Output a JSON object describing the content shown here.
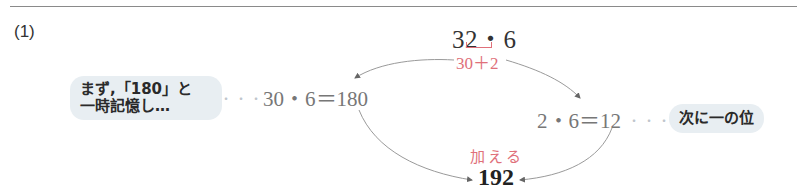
{
  "figure": {
    "problem_label": "(1)",
    "main_expression": "32・6",
    "decomposition": "30＋2",
    "left_note": {
      "line1": "まず,「180」と",
      "line2": "一時記憶し…"
    },
    "left_leader": "・・・",
    "left_expression": "30・6＝180",
    "right_expression": "2・6＝12",
    "right_leader": "・・・",
    "right_note": "次に一の位",
    "add_label": "加える",
    "result": "192"
  },
  "colors": {
    "accent_red": "#e0707a",
    "bubble_bg": "#e8eef2",
    "expression_gray": "#777777",
    "arrow_gray": "#9a9a9a"
  }
}
